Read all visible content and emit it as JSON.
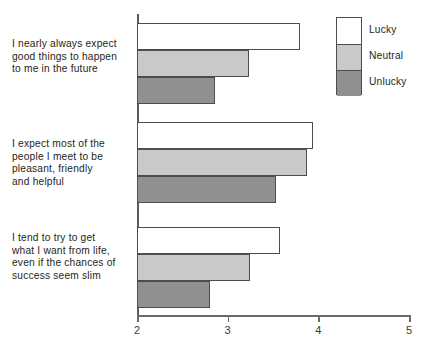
{
  "chart_data": {
    "type": "bar",
    "orientation": "horizontal",
    "title": "",
    "subtitle": "",
    "xlabel": "",
    "ylabel": "",
    "xlim": [
      2,
      5
    ],
    "xticks": [
      "2",
      "3",
      "4",
      "5"
    ],
    "grid": false,
    "legend_position": "top-right",
    "categories": [
      "I nearly always expect good things to happen to me in the future",
      "I expect most of the people I meet to be pleasant, friendly and helpful",
      "I tend to try to get what I want from life, even if the chances of success seem slim"
    ],
    "category_lines": [
      [
        "I nearly always expect",
        "good things to happen",
        "to me in the future"
      ],
      [
        "I expect most of the",
        "people I meet to be",
        "pleasant, friendly",
        "and helpful"
      ],
      [
        "I tend to try to get",
        "what I want from life,",
        "even if the chances of",
        "success seem slim"
      ]
    ],
    "series": [
      {
        "name": "Lucky",
        "color": "#ffffff",
        "values": [
          3.8,
          3.94,
          3.58
        ]
      },
      {
        "name": "Neutral",
        "color": "#c9c9c9",
        "values": [
          3.24,
          3.87,
          3.25
        ]
      },
      {
        "name": "Unlucky",
        "color": "#909090",
        "values": [
          2.86,
          3.53,
          2.8
        ]
      }
    ]
  },
  "legend": {
    "items": [
      {
        "label": "Lucky"
      },
      {
        "label": "Neutral"
      },
      {
        "label": "Unlucky"
      }
    ]
  },
  "axis": {
    "tick_labels": [
      "2",
      "3",
      "4",
      "5"
    ]
  },
  "colors": {
    "lucky": "#ffffff",
    "neutral": "#c9c9c9",
    "unlucky": "#909090",
    "outline": "#4d4d4d",
    "text": "#231f20",
    "axis": "#6a6a6a"
  }
}
